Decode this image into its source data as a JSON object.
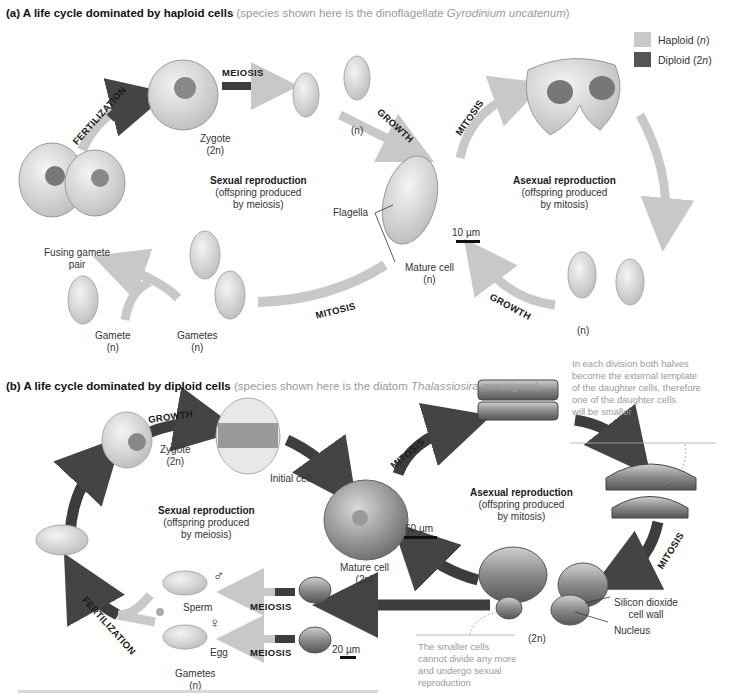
{
  "legend": {
    "haploid": {
      "label": "Haploid (",
      "var": "n",
      "close": ")",
      "color": "#c9c9c9"
    },
    "diploid": {
      "label": "Diploid (2",
      "var": "n",
      "close": ")",
      "color": "#555555"
    }
  },
  "panel_a": {
    "title": "(a) A life cycle dominated by haploid cells",
    "subtitle_pre": "(species shown here is the dinoflagellate ",
    "subtitle_species": "Gyrodinium uncatenum",
    "subtitle_post": ")",
    "arrows": {
      "fertilization": "FERTILIZATION",
      "meiosis": "MEIOSIS",
      "growth_top": "GROWTH",
      "mitosis_right": "MITOSIS",
      "growth_bottom": "GROWTH",
      "mitosis_bottom": "MITOSIS"
    },
    "labels": {
      "zygote": "Zygote",
      "zygote_ploidy": "(2n)",
      "haploid_cells": "(n)",
      "fusing": "Fusing gamete",
      "fusing2": "pair",
      "flagella": "Flagella",
      "scale": "10 µm",
      "mature_cell": "Mature cell",
      "mature_ploidy": "(n)",
      "gamete": "Gamete",
      "gamete_ploidy": "(n)",
      "gametes": "Gametes",
      "gametes_ploidy": "(n)",
      "offspring_ploidy": "(n)"
    },
    "sexual": {
      "title": "Sexual reproduction",
      "line1": "(offspring produced",
      "line2": "by meiosis)"
    },
    "asexual": {
      "title": "Asexual reproduction",
      "line1": "(offspring produced",
      "line2": "by mitosis)"
    }
  },
  "panel_b": {
    "title": "(b) A life cycle dominated by diploid cells",
    "subtitle_pre": "(species shown here is the diatom ",
    "subtitle_species": "Thalassiosira punctigera",
    "subtitle_post": ")",
    "arrows": {
      "growth": "GROWTH",
      "mitosis_top": "MITOSIS",
      "mitosis_right": "MITOSIS",
      "meiosis_1": "MEIOSIS",
      "meiosis_2": "MEIOSIS",
      "fertilization": "FERTILIZATION"
    },
    "labels": {
      "zygote": "Zygote",
      "zygote_ploidy": "(2n)",
      "initial_cell": "Initial cell",
      "mature_cell": "Mature cell",
      "mature_ploidy": "(2n)",
      "scale_60": "60 µm",
      "scale_20": "20 µm",
      "silicon1": "Silicon dioxide",
      "silicon2": "cell wall",
      "nucleus": "Nucleus",
      "small_ploidy": "(2n)",
      "sperm": "Sperm",
      "egg": "Egg",
      "male_symbol": "♂",
      "female_symbol": "♀",
      "gametes": "Gametes",
      "gametes_ploidy": "(n)"
    },
    "sexual": {
      "title": "Sexual reproduction",
      "line1": "(offspring produced",
      "line2": "by meiosis)"
    },
    "asexual": {
      "title": "Asexual reproduction",
      "line1": "(offspring produced",
      "line2": "by mitosis)"
    },
    "note_top": [
      "In each division both halves",
      "become the external template",
      "of the daughter cells, therefore",
      "one of the daughter cells",
      "will be smaller"
    ],
    "note_bottom": [
      "The smaller cells",
      "cannot divide any more",
      "and undergo sexual",
      "reproduction"
    ]
  }
}
